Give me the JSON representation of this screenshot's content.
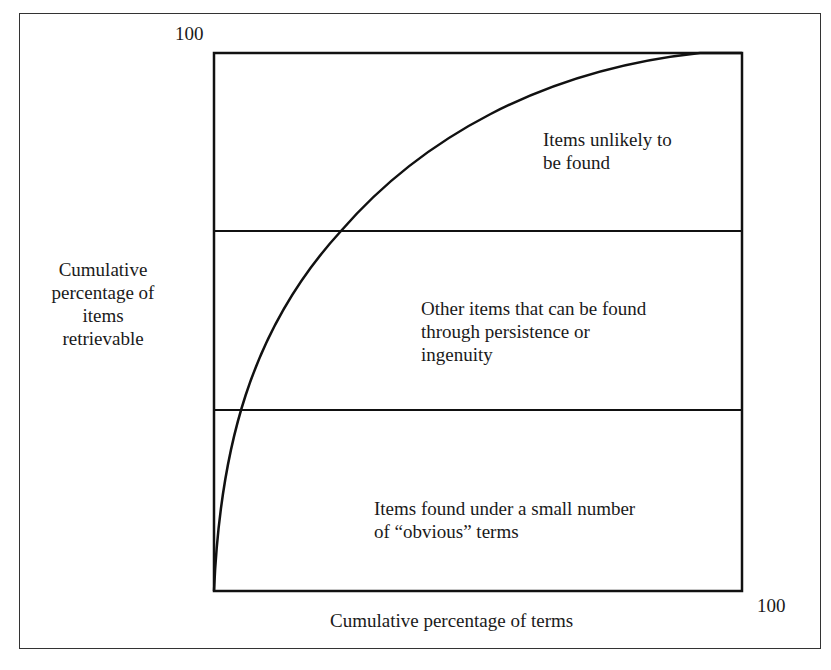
{
  "diagram": {
    "y_axis_label": [
      "Cumulative",
      "percentage of",
      "items",
      "retrievable"
    ],
    "y_axis_max_label": "100",
    "x_axis_label": "Cumulative percentage of terms",
    "x_axis_max_label": "100",
    "bands": [
      {
        "id": "top",
        "lines": [
          "Items unlikely to",
          "be found"
        ]
      },
      {
        "id": "middle",
        "lines": [
          "Other items that can be found",
          "through persistence or",
          "ingenuity"
        ]
      },
      {
        "id": "bottom",
        "lines": [
          "Items found under a small number",
          "of “obvious” terms"
        ]
      }
    ],
    "colors": {
      "line": "#111111",
      "frame": "#333333",
      "background": "#ffffff"
    }
  }
}
